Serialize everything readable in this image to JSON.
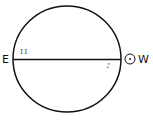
{
  "diagram": {
    "labels": {
      "east": "E",
      "west": "W",
      "roman_two": "II",
      "mark": "♪"
    },
    "symbols": {
      "sun": "sun-symbol"
    },
    "colors": {
      "stroke": "#111111",
      "faint_text": "#777777"
    }
  }
}
